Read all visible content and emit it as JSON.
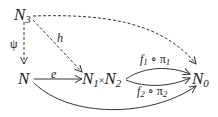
{
  "diagram": {
    "nodes": {
      "n3": {
        "base": "N",
        "sub": "3"
      },
      "n": {
        "base": "N"
      },
      "n1": {
        "base": "N",
        "sub": "1"
      },
      "times": "×",
      "n2": {
        "base": "N",
        "sub": "2"
      },
      "n0": {
        "base": "N",
        "sub": "0"
      }
    },
    "edges": {
      "psi": {
        "label": "ψ",
        "from": "N3",
        "to": "N",
        "style": "dashed"
      },
      "h": {
        "label": "h",
        "from": "N3",
        "to": "N1×N2",
        "style": "dashed"
      },
      "top": {
        "from": "N3",
        "to": "N0",
        "style": "dashed"
      },
      "e": {
        "label": "e",
        "from": "N",
        "to": "N1×N2",
        "style": "solid"
      },
      "f1": {
        "f": "f",
        "fsub": "1",
        "comp": "∘",
        "pi": "π",
        "pisub": "1",
        "from": "N1×N2",
        "to": "N0",
        "style": "solid"
      },
      "f2": {
        "f": "f",
        "fsub": "2",
        "comp": "∘",
        "pi": "π",
        "pisub": "2",
        "from": "N1×N2",
        "to": "N0",
        "style": "solid"
      },
      "bottom": {
        "from": "N",
        "to": "N0",
        "style": "solid"
      }
    }
  }
}
